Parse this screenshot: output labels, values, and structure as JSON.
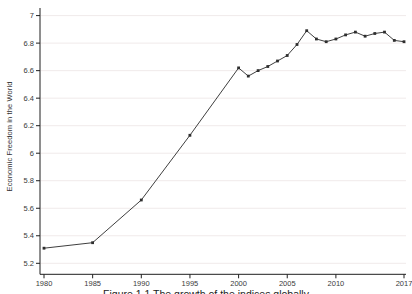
{
  "figure": {
    "ylabel": "Economic Freedom in the World",
    "caption": "Figure 1.1 The growth of the indices globally"
  },
  "chart_data": {
    "type": "line",
    "title": "",
    "xlabel": "",
    "ylabel": "Economic Freedom in the World",
    "x": [
      1980,
      1985,
      1990,
      1995,
      2000,
      2001,
      2002,
      2003,
      2004,
      2005,
      2006,
      2007,
      2008,
      2009,
      2010,
      2011,
      2012,
      2013,
      2014,
      2015,
      2016,
      2017
    ],
    "values": [
      5.31,
      5.35,
      5.66,
      6.13,
      6.62,
      6.56,
      6.6,
      6.63,
      6.67,
      6.71,
      6.79,
      6.89,
      6.83,
      6.81,
      6.83,
      6.86,
      6.88,
      6.85,
      6.87,
      6.88,
      6.82,
      6.81
    ],
    "xticks": [
      1980,
      1985,
      1990,
      1995,
      2000,
      2005,
      2010,
      2017
    ],
    "yticks": [
      5.2,
      5.4,
      5.6,
      5.8,
      6,
      6.2,
      6.4,
      6.6,
      6.8,
      7
    ],
    "xlim": [
      1980,
      2017
    ],
    "ylim": [
      5.2,
      7
    ],
    "grid": "horizontal-faint",
    "legend": "none",
    "marker": "small-square",
    "colors": {
      "line": "#3f3f3f",
      "marker": "#2e2e2e",
      "axis": "#1f1f1f",
      "grid": "#f0eaea",
      "tick_label": "#3a3a3a",
      "background": "#ffffff"
    }
  }
}
